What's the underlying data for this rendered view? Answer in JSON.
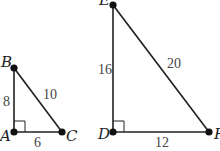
{
  "diagram": {
    "stroke_color": "#222222",
    "triangles": [
      {
        "name": "triangle-ABC",
        "right_angle_at": "A",
        "vertices": {
          "A": {
            "label": "A",
            "x": 14,
            "y": 132
          },
          "B": {
            "label": "B",
            "x": 14,
            "y": 68
          },
          "C": {
            "label": "C",
            "x": 62,
            "y": 132
          }
        },
        "sides": {
          "AB": {
            "label": "8"
          },
          "BC": {
            "label": "10"
          },
          "AC": {
            "label": "6"
          }
        }
      },
      {
        "name": "triangle-DEF",
        "right_angle_at": "D",
        "vertices": {
          "D": {
            "label": "D",
            "x": 113,
            "y": 132
          },
          "E": {
            "label": "E",
            "x": 113,
            "y": 5
          },
          "F": {
            "label": "F",
            "x": 209,
            "y": 132
          }
        },
        "sides": {
          "DE": {
            "label": "16"
          },
          "EF": {
            "label": "20"
          },
          "DF": {
            "label": "12"
          }
        }
      }
    ]
  }
}
